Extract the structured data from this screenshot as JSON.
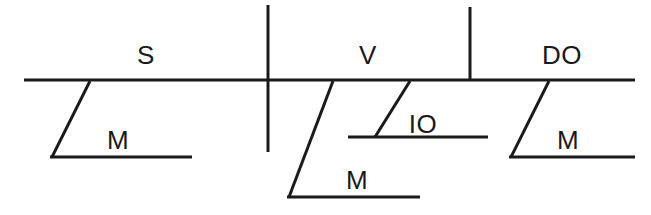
{
  "diagram": {
    "kind": "reed-kellogg-sentence-diagram",
    "stroke_color": "#1a1a1a",
    "background_color": "#ffffff",
    "baseline": {
      "name": "main-baseline",
      "x1": 24,
      "y1": 80,
      "x2": 635,
      "y2": 80,
      "width": 3.2
    },
    "dividers": [
      {
        "name": "subject-verb-divider",
        "x": 268,
        "y1": 5,
        "y2": 152,
        "width": 3.0
      },
      {
        "name": "verb-object-divider",
        "x": 470,
        "y1": 7,
        "y2": 80,
        "width": 3.0
      }
    ],
    "slots": [
      {
        "name": "subject",
        "label": "S",
        "x": 146,
        "y": 55
      },
      {
        "name": "verb",
        "label": "V",
        "x": 368,
        "y": 55
      },
      {
        "name": "direct-object",
        "label": "DO",
        "x": 562,
        "y": 55
      }
    ],
    "modifiers": [
      {
        "name": "subject-modifier",
        "label": "M",
        "label_x": 118,
        "label_y": 140,
        "slant": {
          "x1": 90,
          "y1": 81,
          "x2": 52,
          "y2": 157
        },
        "base": {
          "x1": 50,
          "y1": 157,
          "x2": 192,
          "y2": 157
        },
        "width": 3.0
      },
      {
        "name": "verb-modifier",
        "label": "M",
        "label_x": 357,
        "label_y": 180,
        "slant": {
          "x1": 333,
          "y1": 81,
          "x2": 289,
          "y2": 197
        },
        "base": {
          "x1": 287,
          "y1": 197,
          "x2": 420,
          "y2": 197
        },
        "width": 3.0
      },
      {
        "name": "indirect-object",
        "label": "IO",
        "label_x": 423,
        "label_y": 124,
        "slant": {
          "x1": 410,
          "y1": 81,
          "x2": 375,
          "y2": 137
        },
        "base": {
          "x1": 348,
          "y1": 137,
          "x2": 488,
          "y2": 137
        },
        "width": 3.0
      },
      {
        "name": "direct-object-modifier",
        "label": "M",
        "label_x": 568,
        "label_y": 140,
        "slant": {
          "x1": 549,
          "y1": 81,
          "x2": 511,
          "y2": 157
        },
        "base": {
          "x1": 509,
          "y1": 157,
          "x2": 635,
          "y2": 157
        },
        "width": 3.0
      }
    ]
  }
}
